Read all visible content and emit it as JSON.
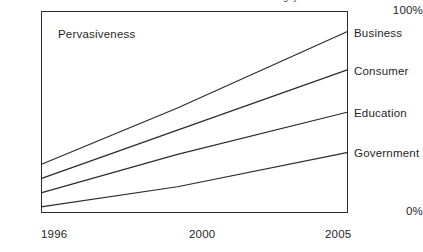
{
  "figure": {
    "clipped_top_text": "g y",
    "annotation": "Pervasiveness"
  },
  "chart_data": {
    "type": "line",
    "title": "",
    "subtitle": "",
    "annotations": [
      "Pervasiveness"
    ],
    "xlabel": "",
    "ylabel": "Pervasiveness",
    "x": [
      1996,
      2000,
      2005
    ],
    "xtick_labels": [
      "1996",
      "2000",
      "2005"
    ],
    "ytick_labels": [
      "100%",
      "0%"
    ],
    "ylim": [
      0,
      100
    ],
    "yunit": "%",
    "grid": false,
    "legend_position": "right-inline-end-of-line",
    "line_color": "#2b2b2b",
    "frame_color": "#2b2b2b",
    "background": "#ffffff",
    "series": [
      {
        "name": "Business",
        "values": [
          24,
          52,
          90
        ]
      },
      {
        "name": "Consumer",
        "values": [
          17,
          41,
          71
        ]
      },
      {
        "name": "Education",
        "values": [
          10,
          29,
          50
        ]
      },
      {
        "name": "Government",
        "values": [
          3,
          13,
          30
        ]
      }
    ]
  }
}
